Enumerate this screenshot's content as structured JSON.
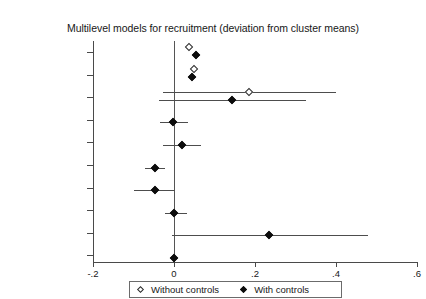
{
  "chart_data": {
    "type": "scatter",
    "title": "Multilevel models for recruitment (deviation from cluster means)",
    "xlabel": "",
    "ylabel": "",
    "xlim": [
      -0.2,
      0.6
    ],
    "xticks": [
      -0.2,
      0,
      0.2,
      0.4,
      0.6
    ],
    "xtick_labels": [
      "-.2",
      "0",
      ".2",
      ".4",
      ".6"
    ],
    "grid": false,
    "zero_reference_line": 0,
    "legend_position": "bottom",
    "categories": [
      "Rebelocracy (cluster mean)",
      "Rebelocracy (dev_mean)",
      "Paramilitaries",
      "Resources",
      "Paved",
      "State",
      "Ideology",
      "Massacres",
      "Cabecera",
      "Elevation"
    ],
    "category_labels": [
      {
        "line1": "Rebelocracy",
        "line2": "(cluster mean)",
        "italic": false
      },
      {
        "line1": "Rebelocracy",
        "line2": "(dev_mean)",
        "italic": false
      },
      {
        "line1": "Paramilitaries",
        "line2": "",
        "italic": false
      },
      {
        "line1": "Resources",
        "line2": "",
        "italic": false
      },
      {
        "line1": "Paved",
        "line2": "",
        "italic": false
      },
      {
        "line1": "State",
        "line2": "",
        "italic": false
      },
      {
        "line1": "Ideology",
        "line2": "",
        "italic": false
      },
      {
        "line1": "Massacres",
        "line2": "",
        "italic": false
      },
      {
        "line1": "Cabecera",
        "line2": "",
        "italic": true
      },
      {
        "line1": "Elevation",
        "line2": "",
        "italic": false
      }
    ],
    "series": [
      {
        "name": "Without controls",
        "marker": "hollow-diamond",
        "color": "#2b2b2b",
        "points": [
          {
            "category": "Rebelocracy (cluster mean)",
            "estimate": 0.036,
            "ci_low": null,
            "ci_high": null
          },
          {
            "category": "Rebelocracy (dev_mean)",
            "estimate": 0.05,
            "ci_low": null,
            "ci_high": null
          },
          {
            "category": "Paramilitaries",
            "estimate": 0.186,
            "ci_low": -0.028,
            "ci_high": 0.4
          },
          {
            "category": "Resources",
            "estimate": null,
            "ci_low": null,
            "ci_high": null
          },
          {
            "category": "Paved",
            "estimate": null,
            "ci_low": null,
            "ci_high": null
          },
          {
            "category": "State",
            "estimate": null,
            "ci_low": null,
            "ci_high": null
          },
          {
            "category": "Ideology",
            "estimate": null,
            "ci_low": null,
            "ci_high": null
          },
          {
            "category": "Massacres",
            "estimate": null,
            "ci_low": null,
            "ci_high": null
          },
          {
            "category": "Cabecera",
            "estimate": null,
            "ci_low": null,
            "ci_high": null
          },
          {
            "category": "Elevation",
            "estimate": null,
            "ci_low": null,
            "ci_high": null
          }
        ]
      },
      {
        "name": "With controls",
        "marker": "filled-diamond",
        "color": "#0d0d0d",
        "points": [
          {
            "category": "Rebelocracy (cluster mean)",
            "estimate": 0.055,
            "ci_low": null,
            "ci_high": null
          },
          {
            "category": "Rebelocracy (dev_mean)",
            "estimate": 0.044,
            "ci_low": null,
            "ci_high": null
          },
          {
            "category": "Paramilitaries",
            "estimate": 0.143,
            "ci_low": -0.038,
            "ci_high": 0.325
          },
          {
            "category": "Resources",
            "estimate": -0.002,
            "ci_low": -0.034,
            "ci_high": 0.034
          },
          {
            "category": "Paved",
            "estimate": 0.019,
            "ci_low": -0.028,
            "ci_high": 0.066
          },
          {
            "category": "State",
            "estimate": -0.046,
            "ci_low": -0.071,
            "ci_high": -0.022
          },
          {
            "category": "Ideology",
            "estimate": -0.047,
            "ci_low": -0.099,
            "ci_high": 0.003
          },
          {
            "category": "Massacres",
            "estimate": 0.0,
            "ci_low": -0.023,
            "ci_high": 0.031
          },
          {
            "category": "Cabecera",
            "estimate": 0.235,
            "ci_low": -0.005,
            "ci_high": 0.48
          },
          {
            "category": "Elevation",
            "estimate": 0.0,
            "ci_low": -0.004,
            "ci_high": 0.004
          }
        ]
      }
    ],
    "legend": [
      {
        "label": "Without controls",
        "marker": "hollow-diamond"
      },
      {
        "label": "With controls",
        "marker": "filled-diamond"
      }
    ]
  }
}
